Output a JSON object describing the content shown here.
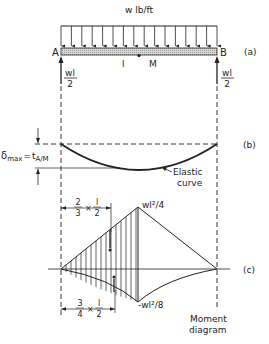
{
  "figure": {
    "part_a": {
      "label": "(a)",
      "load_label": "w lb/ft",
      "support_left": "A",
      "support_right": "B",
      "span_label": "l",
      "midpoint_label": "M",
      "reaction_left": {
        "numerator": "wl",
        "denominator": "2"
      },
      "reaction_right": {
        "numerator": "wl",
        "denominator": "2"
      },
      "load_arrow_count": 16
    },
    "part_b": {
      "label": "(b)",
      "deflection_symbol": "δ",
      "deflection_sub": "max",
      "equals": "=",
      "tangent_symbol": "t",
      "tangent_sub": "A/M",
      "curve_label_line1": "Elastic",
      "curve_label_line2": "curve"
    },
    "part_c": {
      "label": "(c)",
      "positive_peak": "wl²/4",
      "negative_peak": "-wl²/8",
      "dim_top": {
        "a_num": "2",
        "a_den": "3",
        "times": "×",
        "b_num": "l",
        "b_den": "2"
      },
      "dim_bottom": {
        "a_num": "3",
        "a_den": "4",
        "times": "×",
        "b_num": "l",
        "b_den": "2"
      },
      "caption_line1": "Moment",
      "caption_line2": "diagram"
    }
  }
}
